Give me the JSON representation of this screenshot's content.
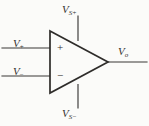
{
  "figure": {
    "kind": "circuit-schematic",
    "background_color": "#fbfbf9",
    "line_color": "#3a3836",
    "text_color": "#33312f"
  },
  "labels": {
    "noninverting_input": {
      "base": "V",
      "sub": "+"
    },
    "inverting_input": {
      "base": "V",
      "sub": "−"
    },
    "positive_supply": {
      "base": "V",
      "sub": "S+"
    },
    "negative_supply": {
      "base": "V",
      "sub": "S−"
    },
    "output": {
      "base": "V",
      "sub": "o"
    }
  },
  "terminals": {
    "plus_sign": "+",
    "minus_sign": "−"
  },
  "geometry": {
    "triangle": {
      "x1": 50,
      "y1": 31,
      "x2": 50,
      "y2": 93,
      "x3": 108,
      "y3": 62
    },
    "noninverting_lead": {
      "x1": 2,
      "y1": 48,
      "x2": 50,
      "y2": 48
    },
    "inverting_lead": {
      "x1": 2,
      "y1": 76,
      "x2": 50,
      "y2": 76
    },
    "positive_supply_lead": {
      "x1": 78,
      "y1": 16,
      "x2": 78,
      "y2": 40
    },
    "negative_supply_lead": {
      "x1": 78,
      "y1": 84,
      "x2": 78,
      "y2": 108
    },
    "output_lead": {
      "x1": 108,
      "y1": 62,
      "x2": 147,
      "y2": 62
    }
  }
}
